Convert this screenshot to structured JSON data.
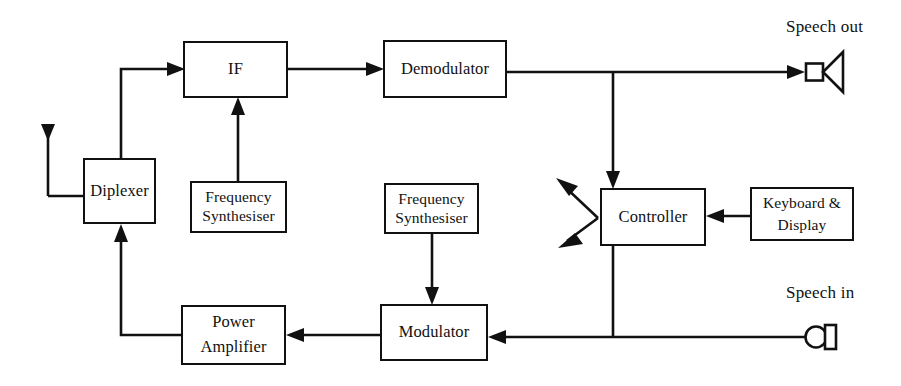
{
  "diagram": {
    "stroke_color": "#111111",
    "background_color": "#ffffff",
    "blocks": [
      {
        "id": "diplexer",
        "lines": [
          "Diplexer"
        ],
        "x": 83,
        "y": 158,
        "w": 73,
        "h": 66
      },
      {
        "id": "if",
        "lines": [
          "IF"
        ],
        "x": 183,
        "y": 41,
        "w": 105,
        "h": 57
      },
      {
        "id": "demodulator",
        "lines": [
          "Demodulator"
        ],
        "x": 383,
        "y": 40,
        "w": 124,
        "h": 58
      },
      {
        "id": "fs_rx",
        "lines": [
          "Frequency",
          "Synthesiser"
        ],
        "x": 190,
        "y": 181,
        "w": 97,
        "h": 52
      },
      {
        "id": "fs_tx",
        "lines": [
          "Frequency",
          "Synthesiser"
        ],
        "x": 384,
        "y": 183,
        "w": 95,
        "h": 51
      },
      {
        "id": "controller",
        "lines": [
          "Controller"
        ],
        "x": 600,
        "y": 188,
        "w": 106,
        "h": 58
      },
      {
        "id": "keyboard",
        "lines": [
          "Keyboard &",
          "Display"
        ],
        "x": 750,
        "y": 187,
        "w": 104,
        "h": 54
      },
      {
        "id": "power_amp",
        "lines": [
          "Power",
          "Amplifier"
        ],
        "x": 181,
        "y": 305,
        "w": 105,
        "h": 60
      },
      {
        "id": "modulator",
        "lines": [
          "Modulator"
        ],
        "x": 380,
        "y": 304,
        "w": 108,
        "h": 57
      }
    ],
    "labels": [
      {
        "id": "speech-out",
        "text": "Speech out",
        "x": 786,
        "y": 17
      },
      {
        "id": "speech-in",
        "text": "Speech in",
        "x": 786,
        "y": 283
      }
    ],
    "icons": [
      {
        "id": "antenna-icon",
        "type": "antenna",
        "x": 48,
        "y": 128
      },
      {
        "id": "speaker-icon",
        "type": "speaker",
        "x": 805,
        "y": 64
      },
      {
        "id": "microphone-icon",
        "type": "microphone",
        "x": 805,
        "y": 327
      }
    ],
    "connections": [
      {
        "id": "antenna-to-diplexer",
        "from": "antenna",
        "to": "diplexer",
        "arrow": false
      },
      {
        "id": "diplexer-to-if",
        "from": "diplexer",
        "to": "if",
        "arrow": true
      },
      {
        "id": "if-to-demodulator",
        "from": "if",
        "to": "demodulator",
        "arrow": true
      },
      {
        "id": "fs-rx-to-if",
        "from": "fs_rx",
        "to": "if",
        "arrow": true
      },
      {
        "id": "demodulator-to-speaker",
        "from": "demodulator",
        "to": "speaker",
        "arrow": true
      },
      {
        "id": "demodulator-to-controller",
        "from": "demodulator",
        "to": "controller",
        "arrow": true
      },
      {
        "id": "keyboard-to-controller",
        "from": "keyboard",
        "to": "controller",
        "arrow": true
      },
      {
        "id": "controller-out-upper",
        "from": "controller",
        "to": "external",
        "arrow": true
      },
      {
        "id": "controller-out-lower",
        "from": "controller",
        "to": "external",
        "arrow": true
      },
      {
        "id": "microphone-to-modulator",
        "from": "microphone",
        "to": "modulator",
        "arrow": true
      },
      {
        "id": "controller-to-modulator",
        "from": "controller",
        "to": "modulator",
        "arrow": true
      },
      {
        "id": "fs-tx-to-modulator",
        "from": "fs_tx",
        "to": "modulator",
        "arrow": true
      },
      {
        "id": "modulator-to-power-amp",
        "from": "modulator",
        "to": "power_amp",
        "arrow": true
      },
      {
        "id": "power-amp-to-diplexer",
        "from": "power_amp",
        "to": "diplexer",
        "arrow": true
      }
    ]
  }
}
